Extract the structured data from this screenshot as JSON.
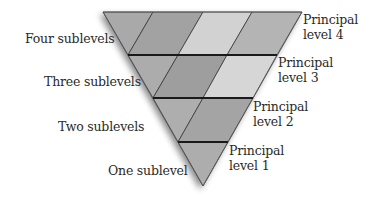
{
  "diagram": {
    "title": "",
    "left_labels": [
      {
        "text": "Four sublevels",
        "x": 25,
        "y": 31
      },
      {
        "text": "Three sublevels",
        "x": 44,
        "y": 74
      },
      {
        "text": "Two sublevels",
        "x": 58,
        "y": 119
      },
      {
        "text": "One sublevel",
        "x": 108,
        "y": 163
      }
    ],
    "right_labels": [
      {
        "line1": "Principal",
        "line2": "level 4",
        "x": 303,
        "y": 12
      },
      {
        "line1": "Principal",
        "line2": "level 3",
        "x": 278,
        "y": 55
      },
      {
        "line1": "Principal",
        "line2": "level 2",
        "x": 253,
        "y": 99
      },
      {
        "line1": "Principal",
        "line2": "level 1",
        "x": 229,
        "y": 143
      }
    ],
    "levels": [
      {
        "principal_level": 4,
        "sublevels": 4,
        "cell_colors": [
          "#a9a9a9",
          "#a2a2a2",
          "#d2d2d2",
          "#b4b4b4"
        ]
      },
      {
        "principal_level": 3,
        "sublevels": 3,
        "cell_colors": [
          "#acacac",
          "#9e9e9e",
          "#d6d6d6"
        ]
      },
      {
        "principal_level": 2,
        "sublevels": 2,
        "cell_colors": [
          "#aeaeae",
          "#a4a4a4"
        ]
      },
      {
        "principal_level": 1,
        "sublevels": 1,
        "cell_colors": [
          "#adadad"
        ]
      }
    ],
    "colors": {
      "divider": "#1a1a1a",
      "cell_edge": "#3a3a3a",
      "shadow": "#9a9a9a",
      "text": "#2a2a2a"
    }
  }
}
